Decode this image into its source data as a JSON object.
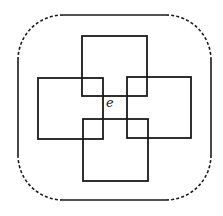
{
  "diagram": {
    "type": "set-diagram",
    "colors": {
      "stroke": "#1a1a1a",
      "background": "#ffffff"
    },
    "boundary": {
      "x": 18,
      "y": 15,
      "width": 193,
      "height": 185,
      "corner_radius": 45,
      "sides_style": "solid",
      "corners_style": "dashed"
    },
    "squares": [
      {
        "id": "top",
        "x": 82,
        "y": 36,
        "width": 65,
        "height": 60
      },
      {
        "id": "left",
        "x": 38,
        "y": 78,
        "width": 65,
        "height": 61
      },
      {
        "id": "right",
        "x": 127,
        "y": 77,
        "width": 64,
        "height": 61
      },
      {
        "id": "bottom",
        "x": 83,
        "y": 119,
        "width": 65,
        "height": 62
      }
    ],
    "labels": [
      {
        "id": "center-point",
        "text": "e",
        "x": 106,
        "y": 96
      }
    ]
  }
}
